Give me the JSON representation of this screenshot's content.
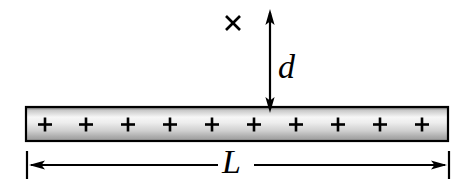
{
  "figure": {
    "type": "physics-diagram",
    "background_color": "#ffffff",
    "stroke_color": "#000000"
  },
  "rod": {
    "name": "charged-rod",
    "charge_sign": "+",
    "charge_count": 10,
    "charge_symbols": [
      "+",
      "+",
      "+",
      "+",
      "+",
      "+",
      "+",
      "+",
      "+",
      "+"
    ],
    "geometry": {
      "left": 25,
      "top": 106,
      "width": 424,
      "height": 36,
      "border_width": 2
    },
    "fill": {
      "style": "vertical-gradient",
      "stops": [
        "#6e6e6e",
        "#f7f7f7",
        "#e6e6e6",
        "#9a9a9a"
      ]
    }
  },
  "distance_marker": {
    "name": "distance-d",
    "label": "d",
    "arrow_style": "double-headed-vertical",
    "x": 270,
    "top_y": 11,
    "bottom_y": 110
  },
  "field_point": {
    "name": "field-point",
    "glyph": "×",
    "x": 233,
    "y": 23
  },
  "length_marker": {
    "name": "length-L",
    "label": "L",
    "arrow_style": "double-headed-horizontal",
    "y": 165,
    "left_x": 27,
    "right_x": 449,
    "tick_top": 151,
    "tick_bottom": 179
  },
  "colors": {
    "stroke": "#000000",
    "background": "#ffffff",
    "rod_light": "#f7f7f7",
    "rod_dark": "#6e6e6e"
  }
}
